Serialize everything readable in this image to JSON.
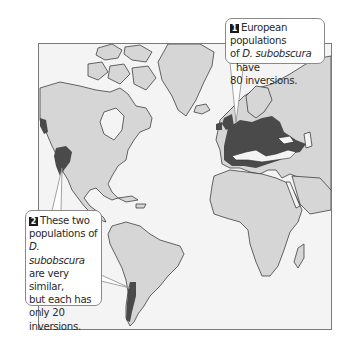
{
  "figure": {
    "type": "world-map-diagram",
    "colors": {
      "ocean": "#f4f4f4",
      "land": "#d6d6d6",
      "coast": "#2a2a2a",
      "population_range": "#4a4a4a",
      "frame": "#7a7a7a",
      "callout_border": "#8a8a8a",
      "badge": "#1a1a1a"
    },
    "regions_highlighted": [
      "Europe and Mediterranean",
      "Western North America (Pacific coast)",
      "Chile (western South America)"
    ]
  },
  "callouts": [
    {
      "number": "1",
      "lines": [
        {
          "pre": "European populations",
          "italic": "",
          "post": ""
        },
        {
          "pre": "of ",
          "italic": "D. subobscura",
          "post": "  have"
        },
        {
          "pre": "80 inversions.",
          "italic": "",
          "post": ""
        }
      ]
    },
    {
      "number": "2",
      "lines": [
        {
          "pre": "These two",
          "italic": "",
          "post": ""
        },
        {
          "pre": "populations of",
          "italic": "",
          "post": ""
        },
        {
          "pre": "",
          "italic": "D. subobscura",
          "post": ""
        },
        {
          "pre": "are very similar,",
          "italic": "",
          "post": ""
        },
        {
          "pre": "but each has",
          "italic": "",
          "post": ""
        },
        {
          "pre": "only 20",
          "italic": "",
          "post": ""
        },
        {
          "pre": "inversions.",
          "italic": "",
          "post": ""
        }
      ]
    }
  ]
}
